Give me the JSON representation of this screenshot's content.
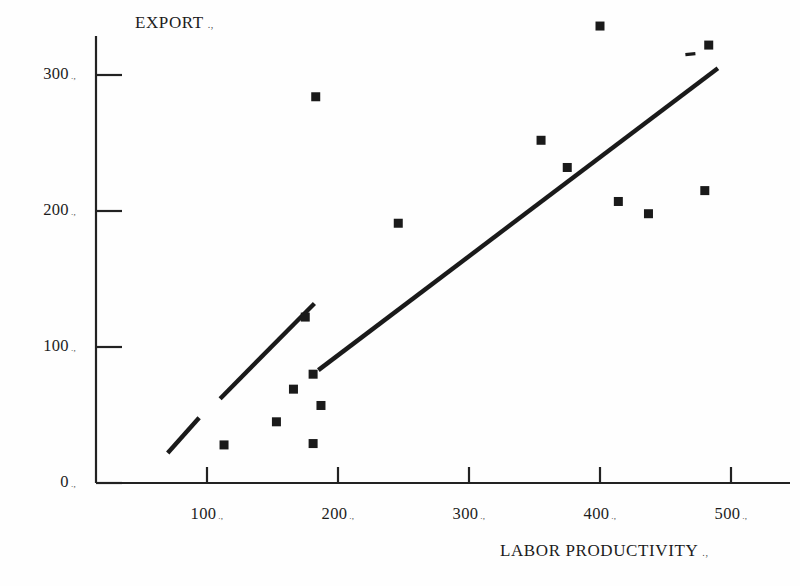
{
  "chart_data": {
    "type": "scatter",
    "title": "",
    "ylabel": "EXPORT",
    "xlabel": "LABOR PRODUCTIVITY",
    "xlabel_trailing": ".,",
    "ylabel_trailing": ".,",
    "grid": false,
    "legend": null,
    "xlim": [
      0,
      540
    ],
    "ylim": [
      0,
      345
    ],
    "x_ticks": [
      100,
      200,
      300,
      400,
      500
    ],
    "y_ticks": [
      0,
      100,
      200,
      300
    ],
    "x_tick_labels": [
      "100",
      "200",
      "300",
      "400",
      "500"
    ],
    "y_tick_labels": [
      "0",
      "100",
      "200",
      "300"
    ],
    "tick_label_trailing": ".,",
    "point_marker": "filled-square",
    "point_color": "#1a1a1a",
    "line_color": "#1a1a1a",
    "points": [
      {
        "x": 113,
        "y": 28
      },
      {
        "x": 153,
        "y": 45
      },
      {
        "x": 166,
        "y": 69
      },
      {
        "x": 175,
        "y": 122
      },
      {
        "x": 183,
        "y": 284
      },
      {
        "x": 181,
        "y": 80
      },
      {
        "x": 187,
        "y": 57
      },
      {
        "x": 181,
        "y": 29
      },
      {
        "x": 246,
        "y": 191
      },
      {
        "x": 355,
        "y": 252
      },
      {
        "x": 375,
        "y": 232
      },
      {
        "x": 400,
        "y": 336
      },
      {
        "x": 414,
        "y": 207
      },
      {
        "x": 437,
        "y": 198
      },
      {
        "x": 483,
        "y": 322
      },
      {
        "x": 480,
        "y": 215
      }
    ],
    "trend_line": {
      "label": "fitted regression line",
      "segments": [
        {
          "x1": 70,
          "y1": 22,
          "x2": 94,
          "y2": 48
        },
        {
          "x1": 110,
          "y1": 62,
          "x2": 182,
          "y2": 132
        },
        {
          "x1": 185,
          "y1": 83,
          "x2": 490,
          "y2": 305
        }
      ],
      "dash_mark": {
        "x": 469,
        "y": 315
      }
    }
  },
  "axis": {
    "y_axis_title": "EXPORT",
    "x_axis_title": "LABOR PRODUCTIVITY"
  }
}
